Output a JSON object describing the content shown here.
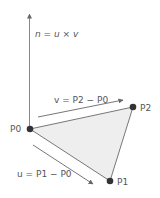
{
  "diagram": {
    "normal_label": "n = u × v",
    "v_label": "v = P2 − P0",
    "u_label": "u = P1 − P0",
    "points": {
      "p0": {
        "label": "P0",
        "x": 30,
        "y": 129
      },
      "p1": {
        "label": "P1",
        "x": 110,
        "y": 181
      },
      "p2": {
        "label": "P2",
        "x": 133,
        "y": 107
      }
    },
    "colors": {
      "line": "#777777",
      "triangle_fill": "#eeeeee",
      "point": "#333333",
      "text": "#555555"
    }
  }
}
